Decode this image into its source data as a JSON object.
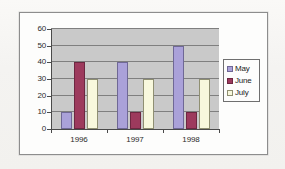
{
  "chart_data": {
    "type": "bar",
    "title": "",
    "xlabel": "",
    "ylabel": "",
    "categories": [
      "1996",
      "1997",
      "1998"
    ],
    "series": [
      {
        "name": "May",
        "color": "#aaa1d9",
        "values": [
          10,
          40,
          50
        ]
      },
      {
        "name": "June",
        "color": "#9d3a5d",
        "values": [
          40,
          10,
          10
        ]
      },
      {
        "name": "July",
        "color": "#f8f8dd",
        "values": [
          30,
          30,
          30
        ]
      }
    ],
    "ylim": [
      0,
      60
    ],
    "ytick_labels": [
      "0",
      "10",
      "20",
      "30",
      "40",
      "50",
      "60"
    ],
    "ytick_values": [
      0,
      10,
      20,
      30,
      40,
      50,
      60
    ],
    "grid": true,
    "legend_position": "right",
    "plot_background": "#c9c9c9",
    "gridline_color": "#7f7f7f",
    "axis_color": "#4a4a4a"
  },
  "legend": {
    "entries": [
      {
        "label": "May"
      },
      {
        "label": "June"
      },
      {
        "label": "July"
      }
    ]
  },
  "frame": {
    "border_color": "#8d8d8d",
    "background": "#fdfdfc"
  }
}
